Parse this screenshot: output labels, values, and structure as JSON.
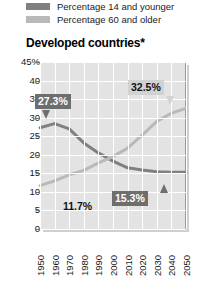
{
  "legend": {
    "items": [
      {
        "label": "Percentage 14 and younger",
        "color": "#808080",
        "swatch_name": "legend-swatch-young"
      },
      {
        "label": "Percentage 60 and older",
        "color": "#b9b9b9",
        "swatch_name": "legend-swatch-old"
      }
    ]
  },
  "title": "Developed countries*",
  "chart_data": {
    "type": "line",
    "title": "Developed countries*",
    "xlabel": "",
    "ylabel": "",
    "ylim": [
      0,
      45
    ],
    "yticks": [
      "45%",
      "40",
      "35",
      "30",
      "25",
      "20",
      "15",
      "10",
      "5",
      "0"
    ],
    "ytick_values": [
      45,
      40,
      35,
      30,
      25,
      20,
      15,
      10,
      5,
      0
    ],
    "x": [
      1950,
      1960,
      1970,
      1980,
      1990,
      2000,
      2010,
      2020,
      2030,
      2040,
      2050
    ],
    "xticklabels": [
      "1950",
      "1960",
      "1970",
      "1980",
      "1990",
      "2000",
      "2010",
      "2020",
      "2030",
      "2040",
      "2050"
    ],
    "grid": true,
    "legend_position": "above-plot",
    "series": [
      {
        "name": "Percentage 14 and younger",
        "color": "#808080",
        "values": [
          27.3,
          28.4,
          27.0,
          23.2,
          20.5,
          18.3,
          16.5,
          15.9,
          15.4,
          15.3,
          15.3
        ]
      },
      {
        "name": "Percentage 60 and older",
        "color": "#b9b9b9",
        "values": [
          11.7,
          13.0,
          14.6,
          15.8,
          17.8,
          19.5,
          21.8,
          25.3,
          29.0,
          31.2,
          32.5
        ]
      }
    ],
    "annotations": [
      {
        "text": "27.3%",
        "series": "Percentage 14 and younger",
        "x": 1950,
        "y": 27.3,
        "style": "dark"
      },
      {
        "text": "11.7%",
        "series": "Percentage 60 and older",
        "x": 1950,
        "y": 11.7,
        "style": "plain"
      },
      {
        "text": "32.5%",
        "series": "Percentage 60 and older",
        "x": 2050,
        "y": 32.5,
        "style": "light"
      },
      {
        "text": "15.3%",
        "series": "Percentage 14 and younger",
        "x": 2050,
        "y": 15.3,
        "style": "dark"
      }
    ]
  }
}
